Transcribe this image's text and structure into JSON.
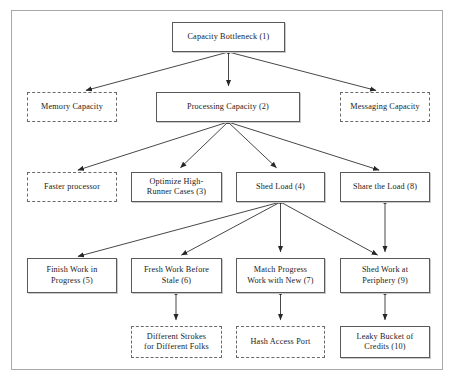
{
  "diagram": {
    "type": "tree-diagram",
    "background_color": "#ffffff",
    "frame_color": "#a8a8a8",
    "solid_border_color": "#5a5a5a",
    "dashed_border_color": "#6a6a6a",
    "text_color": "#1a1a1a",
    "edge_color": "#262626",
    "nodes": [
      {
        "id": "capacity-bottleneck",
        "label": "Capacity Bottleneck (1)",
        "number": "1",
        "style": "solid",
        "x": 172,
        "y": 22,
        "w": 113,
        "h": 30,
        "level": 0
      },
      {
        "id": "memory-capacity",
        "label": "Memory Capacity",
        "number": "",
        "style": "dashed",
        "x": 27,
        "y": 92,
        "w": 90,
        "h": 30,
        "level": 1
      },
      {
        "id": "processing-capacity",
        "label": "Processing Capacity (2)",
        "number": "2",
        "style": "solid",
        "x": 156,
        "y": 92,
        "w": 144,
        "h": 30,
        "level": 1
      },
      {
        "id": "messaging-capacity",
        "label": "Messaging Capacity",
        "number": "",
        "style": "dashed",
        "x": 340,
        "y": 92,
        "w": 90,
        "h": 30,
        "level": 1
      },
      {
        "id": "faster-processor",
        "label": "Faster processor",
        "number": "",
        "style": "dashed",
        "x": 27,
        "y": 172,
        "w": 90,
        "h": 30,
        "level": 2
      },
      {
        "id": "optimize-high-runner-cases",
        "label": "Optimize High-\nRunner Cases (3)",
        "number": "3",
        "style": "solid",
        "x": 131,
        "y": 172,
        "w": 91,
        "h": 30,
        "level": 2
      },
      {
        "id": "shed-load",
        "label": "Shed Load (4)",
        "number": "4",
        "style": "solid",
        "x": 236,
        "y": 172,
        "w": 89,
        "h": 30,
        "level": 2
      },
      {
        "id": "share-the-load",
        "label": "Share the Load (8)",
        "number": "8",
        "style": "solid",
        "x": 340,
        "y": 172,
        "w": 90,
        "h": 30,
        "level": 2
      },
      {
        "id": "finish-work-in-progress",
        "label": "Finish Work in\nProgress (5)",
        "number": "5",
        "style": "solid",
        "x": 27,
        "y": 258,
        "w": 90,
        "h": 35,
        "level": 3
      },
      {
        "id": "fresh-work-before-stale",
        "label": "Fresh Work Before\nStale (6)",
        "number": "6",
        "style": "solid",
        "x": 131,
        "y": 258,
        "w": 91,
        "h": 35,
        "level": 3
      },
      {
        "id": "match-progress-work-with-new",
        "label": "Match Progress\nWork with New (7)",
        "number": "7",
        "style": "solid",
        "x": 236,
        "y": 258,
        "w": 89,
        "h": 35,
        "level": 3
      },
      {
        "id": "shed-work-at-periphery",
        "label": "Shed Work at\nPeriphery (9)",
        "number": "9",
        "style": "solid",
        "x": 340,
        "y": 258,
        "w": 90,
        "h": 35,
        "level": 3
      },
      {
        "id": "different-strokes-for-different-folks",
        "label": "Different Strokes\nfor Different Folks",
        "number": "",
        "style": "dashed",
        "x": 131,
        "y": 326,
        "w": 91,
        "h": 32,
        "level": 4
      },
      {
        "id": "hash-access-port",
        "label": "Hash Access Port",
        "number": "",
        "style": "dashed",
        "x": 236,
        "y": 326,
        "w": 89,
        "h": 32,
        "level": 4
      },
      {
        "id": "leaky-bucket-of-credits",
        "label": "Leaky Bucket of\nCredits (10)",
        "number": "10",
        "style": "solid",
        "x": 340,
        "y": 326,
        "w": 90,
        "h": 32,
        "level": 4
      }
    ],
    "edges": [
      {
        "from": "capacity-bottleneck",
        "to": "memory-capacity",
        "x1": 228.5,
        "y1": 52,
        "x2": 80,
        "y2": 92,
        "dot": true
      },
      {
        "from": "capacity-bottleneck",
        "to": "processing-capacity",
        "x1": 228.5,
        "y1": 52,
        "x2": 228.5,
        "y2": 92,
        "dot": false
      },
      {
        "from": "capacity-bottleneck",
        "to": "messaging-capacity",
        "x1": 228.5,
        "y1": 52,
        "x2": 382,
        "y2": 92,
        "dot": false
      },
      {
        "from": "processing-capacity",
        "to": "faster-processor",
        "x1": 228,
        "y1": 122,
        "x2": 72,
        "y2": 172,
        "dot": true
      },
      {
        "from": "processing-capacity",
        "to": "optimize-high-runner-cases",
        "x1": 228,
        "y1": 122,
        "x2": 176,
        "y2": 172,
        "dot": false
      },
      {
        "from": "processing-capacity",
        "to": "shed-load",
        "x1": 228,
        "y1": 122,
        "x2": 281,
        "y2": 172,
        "dot": false
      },
      {
        "from": "processing-capacity",
        "to": "share-the-load",
        "x1": 228,
        "y1": 122,
        "x2": 385,
        "y2": 172,
        "dot": false
      },
      {
        "from": "shed-load",
        "to": "finish-work-in-progress",
        "x1": 280.5,
        "y1": 202,
        "x2": 72,
        "y2": 258,
        "dot": true
      },
      {
        "from": "shed-load",
        "to": "fresh-work-before-stale",
        "x1": 280.5,
        "y1": 202,
        "x2": 176,
        "y2": 258,
        "dot": false
      },
      {
        "from": "shed-load",
        "to": "match-progress-work-with-new",
        "x1": 280.5,
        "y1": 202,
        "x2": 280.5,
        "y2": 258,
        "dot": false
      },
      {
        "from": "shed-load",
        "to": "shed-work-at-periphery",
        "x1": 280.5,
        "y1": 202,
        "x2": 383,
        "y2": 258,
        "dot": false
      },
      {
        "from": "share-the-load",
        "to": "shed-work-at-periphery",
        "x1": 385,
        "y1": 202,
        "x2": 385,
        "y2": 258,
        "dot": true
      },
      {
        "from": "fresh-work-before-stale",
        "to": "different-strokes-for-different-folks",
        "x1": 176,
        "y1": 293,
        "x2": 176,
        "y2": 326,
        "dot": true
      },
      {
        "from": "match-progress-work-with-new",
        "to": "hash-access-port",
        "x1": 280.5,
        "y1": 293,
        "x2": 280.5,
        "y2": 326,
        "dot": true
      },
      {
        "from": "shed-work-at-periphery",
        "to": "leaky-bucket-of-credits",
        "x1": 385,
        "y1": 293,
        "x2": 385,
        "y2": 326,
        "dot": true
      }
    ]
  }
}
